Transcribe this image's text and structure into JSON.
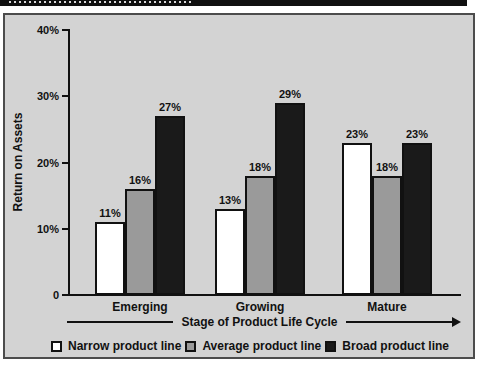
{
  "header": {
    "note": "black title bar, text cropped out of frame at top of screenshot"
  },
  "chart_data": {
    "type": "bar",
    "title": "",
    "categories": [
      "Emerging",
      "Growing",
      "Mature"
    ],
    "series": [
      {
        "name": "Narrow product line",
        "fill": "#ffffff",
        "values": [
          11,
          13,
          23
        ]
      },
      {
        "name": "Average product line",
        "fill": "#9a9a9a",
        "values": [
          16,
          18,
          18
        ]
      },
      {
        "name": "Broad product line",
        "fill": "#1a1a1a",
        "values": [
          27,
          29,
          23
        ]
      }
    ],
    "bar_value_labels": [
      "11%",
      "16%",
      "27%",
      "13%",
      "18%",
      "29%",
      "23%",
      "18%",
      "23%"
    ],
    "ylabel": "Return on Assets",
    "xlabel": "Stage of Product Life Cycle",
    "y_ticks": [
      {
        "label": "0",
        "value": 0
      },
      {
        "label": "10%",
        "value": 10
      },
      {
        "label": "20%",
        "value": 20
      },
      {
        "label": "30%",
        "value": 30
      },
      {
        "label": "40%",
        "value": 40
      }
    ],
    "ylim": [
      0,
      40
    ],
    "grid": false,
    "legend_position": "bottom",
    "colors": {
      "figure_background": "#d3d3d3",
      "frame_border": "#4c4c4c",
      "axis": "#111111",
      "title_bar": "#101010"
    }
  }
}
